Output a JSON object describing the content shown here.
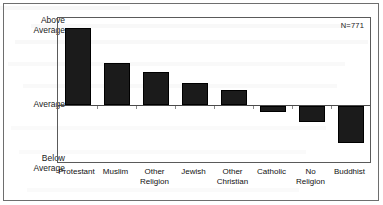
{
  "annotation": "N=771",
  "y_axis": {
    "above_label": "Above\nAverage",
    "average_label": "Average",
    "below_label": "Below\nAverage"
  },
  "chart_data": {
    "type": "bar",
    "title": "",
    "subtitle": "",
    "xlabel": "",
    "ylabel": "",
    "annotation": "N=771",
    "grid": false,
    "legend": false,
    "baseline": 0,
    "ylim": [
      -3.0,
      2.5
    ],
    "ytick_labels": [
      "Above Average",
      "Average",
      "Below Average"
    ],
    "ytick_values": [
      2.5,
      0,
      -3.0
    ],
    "categories": [
      "Protestant",
      "Muslim",
      "Other\nReligion",
      "Jewish",
      "Other\nChristian",
      "Catholic",
      "No Religion",
      "Buddhist"
    ],
    "category_labels_flat": [
      "Protestant",
      "Muslim",
      "Other Religion",
      "Jewish",
      "Other Christian",
      "Catholic",
      "No Religion",
      "Buddhist"
    ],
    "values": [
      2.21,
      1.22,
      0.96,
      0.62,
      0.42,
      -0.3,
      -0.85,
      -1.95
    ],
    "bar_color": "#1b1b1b"
  }
}
